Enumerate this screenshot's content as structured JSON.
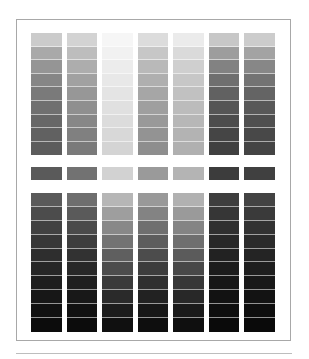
{
  "chart_data": {
    "type": "heatmap",
    "title": "",
    "columns": 7,
    "top_section": [
      [
        "#cbcbcb",
        "#a9a9a9",
        "#959595",
        "#868686",
        "#7a7a7a",
        "#707070",
        "#676767",
        "#616161",
        "#5c5c5c"
      ],
      [
        "#d3d3d3",
        "#bdbdbd",
        "#adadad",
        "#a1a1a1",
        "#979797",
        "#8f8f8f",
        "#878787",
        "#808080",
        "#7a7a7a"
      ],
      [
        "#f6f6f6",
        "#f1f1f1",
        "#ececec",
        "#e8e8e8",
        "#e4e4e4",
        "#e0e0e0",
        "#dcdcdc",
        "#d8d8d8",
        "#d4d4d4"
      ],
      [
        "#dcdcdc",
        "#c7c7c7",
        "#b9b9b9",
        "#afafaf",
        "#a6a6a6",
        "#9f9f9f",
        "#999999",
        "#939393",
        "#8e8e8e"
      ],
      [
        "#ebebeb",
        "#dadada",
        "#cfcfcf",
        "#c7c7c7",
        "#c1c1c1",
        "#bcbcbc",
        "#b7b7b7",
        "#b3b3b3",
        "#b0b0b0"
      ],
      [
        "#c7c7c7",
        "#9d9d9d",
        "#828282",
        "#6f6f6f",
        "#616161",
        "#555555",
        "#4c4c4c",
        "#454545",
        "#404040"
      ],
      [
        "#cccccc",
        "#a3a3a3",
        "#878787",
        "#737373",
        "#646464",
        "#585858",
        "#4f4f4f",
        "#484848",
        "#444444"
      ]
    ],
    "middle_strip": [
      "#5a5a5a",
      "#727272",
      "#d2d2d2",
      "#9a9a9a",
      "#b4b4b4",
      "#3c3c3c",
      "#404040"
    ],
    "bottom_section": [
      [
        "#5a5a5a",
        "#4c4c4c",
        "#414141",
        "#373737",
        "#2e2e2e",
        "#262626",
        "#1e1e1e",
        "#171717",
        "#111111",
        "#0c0c0c"
      ],
      [
        "#6e6e6e",
        "#5a5a5a",
        "#4a4a4a",
        "#3d3d3d",
        "#323232",
        "#282828",
        "#1f1f1f",
        "#181818",
        "#111111",
        "#0c0c0c"
      ],
      [
        "#b6b6b6",
        "#9e9e9e",
        "#888888",
        "#737373",
        "#5f5f5f",
        "#4c4c4c",
        "#3a3a3a",
        "#2a2a2a",
        "#1c1c1c",
        "#101010"
      ],
      [
        "#999999",
        "#838383",
        "#6f6f6f",
        "#5d5d5d",
        "#4c4c4c",
        "#3d3d3d",
        "#2f2f2f",
        "#222222",
        "#171717",
        "#0e0e0e"
      ],
      [
        "#b1b1b1",
        "#9a9a9a",
        "#848484",
        "#6f6f6f",
        "#5b5b5b",
        "#484848",
        "#373737",
        "#282828",
        "#1a1a1a",
        "#0f0f0f"
      ],
      [
        "#3e3e3e",
        "#363636",
        "#2f2f2f",
        "#282828",
        "#222222",
        "#1c1c1c",
        "#171717",
        "#121212",
        "#0e0e0e",
        "#0a0a0a"
      ],
      [
        "#434343",
        "#3a3a3a",
        "#323232",
        "#2b2b2b",
        "#242424",
        "#1e1e1e",
        "#181818",
        "#131313",
        "#0e0e0e",
        "#0a0a0a"
      ]
    ]
  },
  "caption": ""
}
